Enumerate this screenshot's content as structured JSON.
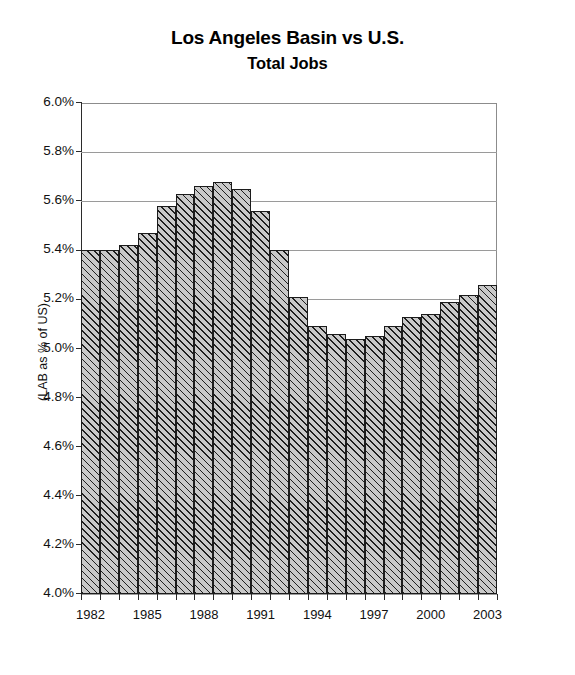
{
  "chart_data": {
    "type": "bar",
    "title": "Los Angeles Basin vs U.S.",
    "subtitle": "Total Jobs",
    "xlabel": "",
    "ylabel": "(LAB as % of US)",
    "ylim": [
      4.0,
      6.0
    ],
    "ytick_step": 0.2,
    "ytick_labels": [
      "6.0%",
      "5.8%",
      "5.6%",
      "5.4%",
      "5.2%",
      "5.0%",
      "4.8%",
      "4.6%",
      "4.4%",
      "4.2%",
      "4.0%"
    ],
    "ytick_values": [
      6.0,
      5.8,
      5.6,
      5.4,
      5.2,
      5.0,
      4.8,
      4.6,
      4.4,
      4.2,
      4.0
    ],
    "xtick_labels": [
      "1982",
      "1985",
      "1988",
      "1991",
      "1994",
      "1997",
      "2000",
      "2003"
    ],
    "categories": [
      "1982",
      "1983",
      "1984",
      "1985",
      "1986",
      "1987",
      "1988",
      "1989",
      "1990",
      "1991",
      "1992",
      "1993",
      "1994",
      "1995",
      "1996",
      "1997",
      "1998",
      "1999",
      "2000",
      "2001",
      "2002",
      "2003"
    ],
    "values": [
      5.4,
      5.4,
      5.42,
      5.47,
      5.58,
      5.63,
      5.66,
      5.68,
      5.65,
      5.56,
      5.4,
      5.21,
      5.09,
      5.06,
      5.04,
      5.05,
      5.09,
      5.13,
      5.14,
      5.19,
      5.22,
      5.26
    ],
    "value_unit": "%",
    "grid": true,
    "legend": false,
    "bar_fill_color": "#c9c9c9",
    "bar_hatch": "diagonal-forward",
    "bar_edge_color": "#1c1c1c",
    "axis_color": "#2b2b2b",
    "gridline_color": "#9a9a9a"
  }
}
